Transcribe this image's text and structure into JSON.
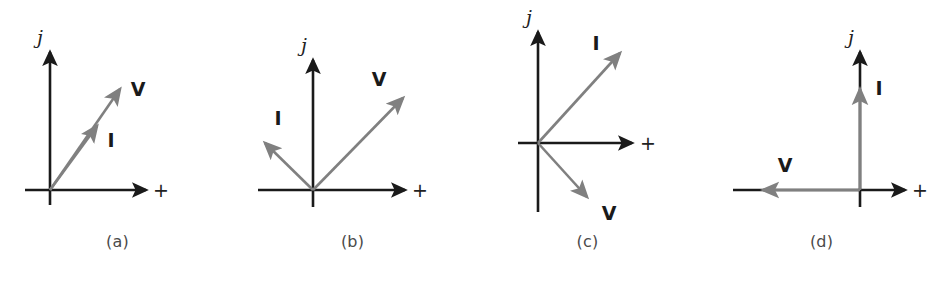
{
  "figure": {
    "background_color": "#ffffff",
    "axis_color": "#1a1a1a",
    "vector_color": "#808080",
    "label_color": "#1a1a1a",
    "caption_color": "#4a4a4a",
    "width": 938,
    "height": 288
  },
  "panels": [
    {
      "id": "a",
      "caption": "(a)",
      "axis_j_label": "j",
      "axis_real_label": "+",
      "vectors": [
        {
          "name": "V",
          "label": "V",
          "angle_deg": 55,
          "length": 126,
          "relative_length": "long"
        },
        {
          "name": "I",
          "label": "I",
          "angle_deg": 55,
          "length": 78,
          "relative_length": "short"
        }
      ],
      "description": "V and I are in phase (collinear), both in the first quadrant"
    },
    {
      "id": "b",
      "caption": "(b)",
      "axis_j_label": "j",
      "axis_real_label": "+",
      "vectors": [
        {
          "name": "V",
          "label": "V",
          "angle_deg": 46,
          "length": 132,
          "relative_length": "long"
        },
        {
          "name": "I",
          "label": "I",
          "angle_deg": 136,
          "length": 71,
          "relative_length": "short"
        }
      ],
      "description": "I leads V by about 90 degrees; V in first quadrant, I in second quadrant"
    },
    {
      "id": "c",
      "caption": "(c)",
      "axis_j_label": "j",
      "axis_real_label": "+",
      "vectors": [
        {
          "name": "I",
          "label": "I",
          "angle_deg": 48,
          "length": 125,
          "relative_length": "long"
        },
        {
          "name": "V",
          "label": "V",
          "angle_deg": -48,
          "length": 75,
          "relative_length": "short"
        }
      ],
      "description": "I in first quadrant, V in fourth quadrant"
    },
    {
      "id": "d",
      "caption": "(d)",
      "axis_j_label": "j",
      "axis_real_label": "+",
      "vectors": [
        {
          "name": "I",
          "label": "I",
          "angle_deg": 90,
          "length": 105,
          "relative_length": "long"
        },
        {
          "name": "V",
          "label": "V",
          "angle_deg": 180,
          "length": 100,
          "relative_length": "long"
        }
      ],
      "description": "I points along the positive j axis, V points along the negative real axis"
    }
  ]
}
